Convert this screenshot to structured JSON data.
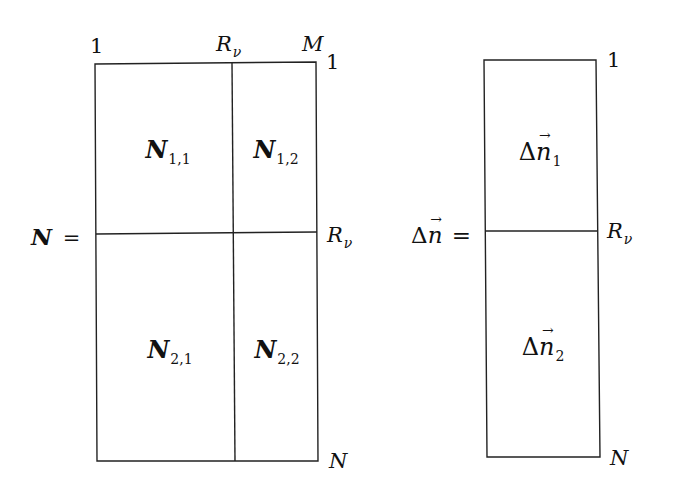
{
  "left_matrix": {
    "name": "N",
    "equals": "=",
    "column_labels": {
      "first": "1",
      "split": "R",
      "split_sub": "ν",
      "last": "M"
    },
    "row_labels": {
      "first": "1",
      "split": "R",
      "split_sub": "ν",
      "last": "N"
    },
    "blocks": [
      {
        "symbol": "N",
        "sub": "1,1"
      },
      {
        "symbol": "N",
        "sub": "1,2"
      },
      {
        "symbol": "N",
        "sub": "2,1"
      },
      {
        "symbol": "N",
        "sub": "2,2"
      }
    ]
  },
  "right_vector": {
    "name_delta": "Δ",
    "name_symbol": "n",
    "equals": "=",
    "row_labels": {
      "first": "1",
      "split": "R",
      "split_sub": "ν",
      "last": "N"
    },
    "blocks": [
      {
        "delta": "Δ",
        "symbol": "n",
        "sub": "1"
      },
      {
        "delta": "Δ",
        "symbol": "n",
        "sub": "2"
      }
    ]
  },
  "colors": {
    "line": "#222222",
    "background": "#ffffff",
    "text": "#111111"
  }
}
